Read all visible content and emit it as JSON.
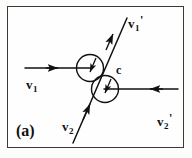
{
  "figure": {
    "panel_label": "(a)",
    "caption_id": "a",
    "frame": {
      "visible": true,
      "color": "#3a3a3a"
    },
    "background_color": "#fdfdfc",
    "ink_color": "#111111"
  },
  "labels": {
    "v1_in": {
      "base": "v",
      "sub": "1",
      "prime": ""
    },
    "v2_in": {
      "base": "v",
      "sub": "2",
      "prime": ""
    },
    "v1_out": {
      "base": "v",
      "sub": "1",
      "prime": "'"
    },
    "v2_out": {
      "base": "v",
      "sub": "2",
      "prime": "'"
    },
    "center": {
      "base": "c",
      "sub": "",
      "prime": ""
    }
  },
  "vectors": [
    {
      "name": "v1-in",
      "label": "v1",
      "direction": "right",
      "arrow": "forward"
    },
    {
      "name": "v2-in",
      "label": "v2",
      "direction": "up-right",
      "arrow": "forward"
    },
    {
      "name": "v1-out",
      "label": "v1'",
      "direction": "up-right",
      "arrow": "forward"
    },
    {
      "name": "v2-out",
      "label": "v2'",
      "direction": "left",
      "arrow": "forward"
    }
  ],
  "circles": [
    {
      "name": "upper-collision-circle",
      "cx": 90,
      "cy": 68,
      "r": 13.5
    },
    {
      "name": "lower-collision-circle",
      "cx": 105,
      "cy": 89,
      "r": 13.5
    }
  ]
}
